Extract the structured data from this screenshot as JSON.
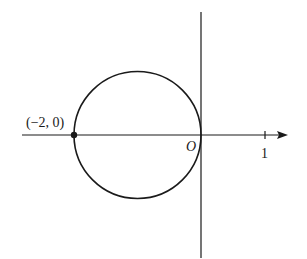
{
  "diagram": {
    "type": "coordinate-plot",
    "axes": {
      "x_axis": {
        "arrow": true,
        "ticks": [
          {
            "value": 1,
            "label": "1"
          }
        ]
      },
      "y_axis": {
        "arrow": false
      },
      "origin_label": "O"
    },
    "circle": {
      "center": [
        -1,
        0
      ],
      "radius": 1
    },
    "points": [
      {
        "coords": [
          -2,
          0
        ],
        "label": "(−2, 0)",
        "filled": true
      }
    ],
    "colors": {
      "stroke": "#1a1a1a",
      "background": "#ffffff"
    }
  }
}
